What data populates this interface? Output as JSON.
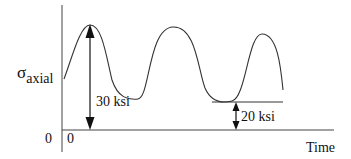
{
  "diagram": {
    "type": "stress-time cyclic loading diagram",
    "y_axis_label": {
      "symbol": "σ",
      "subscript": "axial"
    },
    "x_axis_label": "Time",
    "y_origin_label": "0",
    "x_origin_label": "0",
    "waveform": {
      "description": "varying-amplitude sinusoidal axial stress",
      "peaks_visible": 3,
      "max_stress_ksi": 30,
      "min_stress_ksi": 20
    },
    "annotations": [
      {
        "name": "max-stress",
        "text": "30 ksi",
        "value_ksi": 30,
        "refers_to": "first peak above zero"
      },
      {
        "name": "min-stress",
        "text": "20 ksi",
        "value_ksi": 20,
        "refers_to": "minimum trough above zero"
      }
    ],
    "colors": {
      "line": "#222222",
      "background": "#ffffff"
    }
  }
}
